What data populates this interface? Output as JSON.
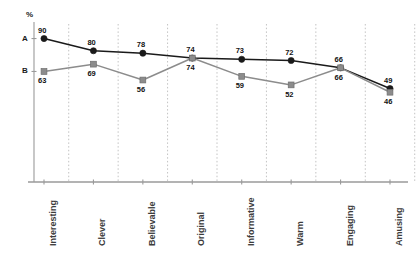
{
  "chart_data": {
    "type": "line",
    "title": "",
    "xlabel": "",
    "ylabel": "%",
    "categories": [
      "Interesting",
      "Clever",
      "Believable",
      "Original",
      "Informative",
      "Warm",
      "Engaging",
      "Amusing"
    ],
    "series": [
      {
        "name": "A",
        "marker": "circle",
        "color": "#1a1a1a",
        "values": [
          90,
          80,
          78,
          74,
          73,
          72,
          66,
          49
        ]
      },
      {
        "name": "B",
        "marker": "square",
        "color": "#8c8c8c",
        "values": [
          63,
          69,
          56,
          74,
          59,
          52,
          66,
          46
        ]
      }
    ],
    "y_axis_ticks": [
      {
        "label": "A",
        "value": 90
      },
      {
        "label": "B",
        "value": 63
      }
    ],
    "ylim": [
      0,
      97
    ],
    "grid": "vertical-dotted",
    "legend": "none",
    "axis_unit_label": "%"
  },
  "colors": {
    "series_a": "#1a1a1a",
    "series_b": "#8c8c8c",
    "axis": "#9a9a9a",
    "grid": "#b4b4b4",
    "text": "#1a1a1a",
    "category_text": "#3c3c3c",
    "background": "#ffffff"
  }
}
